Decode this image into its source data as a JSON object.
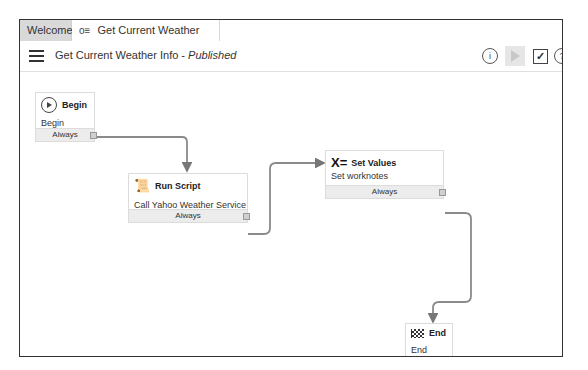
{
  "tabs": [
    {
      "label": "Welcome",
      "active": false
    },
    {
      "label": "Get Current Weather Info",
      "icon": "workflow-icon",
      "active": true
    }
  ],
  "toolbar": {
    "title": "Get Current Weather Info",
    "separator": " - ",
    "status": "Published",
    "icons": [
      "menu-icon",
      "info-icon",
      "run-icon",
      "checkout-icon",
      "help-icon"
    ],
    "info_glyph": "i",
    "check_glyph": "✓",
    "help_glyph": "?"
  },
  "nodes": {
    "begin": {
      "title": "Begin",
      "subtitle": "Begin",
      "condition": "Always",
      "icon": "play-circle-icon"
    },
    "run_script": {
      "title": "Run Script",
      "subtitle": "Call Yahoo Weather Service",
      "condition": "Always",
      "icon": "script-icon",
      "icon_glyph": "📜"
    },
    "set_values": {
      "title": "Set Values",
      "subtitle": "Set worknotes",
      "condition": "Always",
      "icon": "set-values-icon",
      "icon_glyph": "X="
    },
    "end": {
      "title": "End",
      "subtitle": "End",
      "icon": "checkered-flag-icon"
    }
  },
  "colors": {
    "wire": "#8a8a8a",
    "footer_bg": "#ececec",
    "tab_inactive": "#d9d9d9"
  }
}
